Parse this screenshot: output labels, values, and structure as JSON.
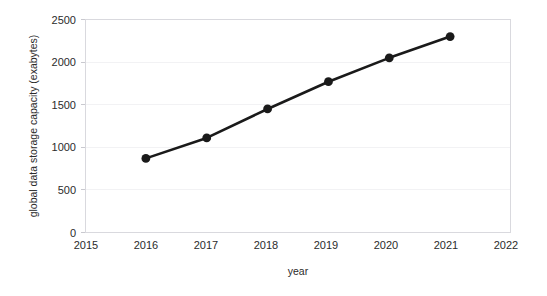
{
  "chart_data": {
    "type": "line",
    "title": "",
    "xlabel": "year",
    "ylabel": "global data storage capacity (exabytes)",
    "x": [
      2016,
      2017,
      2018,
      2019,
      2020,
      2021
    ],
    "values": [
      870,
      1110,
      1450,
      1770,
      2050,
      2300
    ],
    "series": [
      {
        "name": "global data storage capacity",
        "values": [
          870,
          1110,
          1450,
          1770,
          2050,
          2300
        ]
      }
    ],
    "xlim": [
      2015,
      2022
    ],
    "ylim": [
      0,
      2500
    ],
    "xticks": [
      "2015",
      "2016",
      "2017",
      "2018",
      "2019",
      "2020",
      "2021",
      "2022"
    ],
    "xtick_values": [
      2015,
      2016,
      2017,
      2018,
      2019,
      2020,
      2021,
      2022
    ],
    "yticks": [
      "0",
      "500",
      "1000",
      "1500",
      "2000",
      "2500"
    ],
    "ytick_values": [
      0,
      500,
      1000,
      1500,
      2000,
      2500
    ],
    "grid": "horizontal",
    "legend": "none",
    "marker": "circle",
    "colors": {
      "line": "#1a1a1a",
      "marker": "#1a1a1a",
      "grid": "#f2f2f4",
      "axis": "#d9d9de",
      "text": "#2b2b2b",
      "background": "#ffffff"
    }
  }
}
